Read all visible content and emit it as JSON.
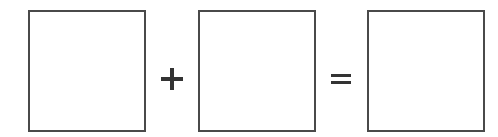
{
  "equation": {
    "operands": [
      {
        "id": "box-1",
        "value": ""
      },
      {
        "id": "box-2",
        "value": ""
      },
      {
        "id": "result",
        "value": ""
      }
    ],
    "operators": {
      "plus": "+",
      "equals": "="
    }
  }
}
